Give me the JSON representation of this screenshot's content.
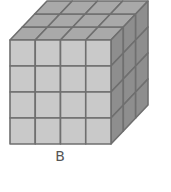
{
  "figure": {
    "label": "B",
    "front_grid": {
      "columns": 4,
      "rows": 4
    },
    "depth_layers": 3,
    "geometry": {
      "front": {
        "x0": 10,
        "y0": 40,
        "x1": 111,
        "y1": 144
      },
      "depth_offset": {
        "dx": 37,
        "dy": -39
      }
    },
    "colors": {
      "front": "#c9c9c9",
      "top": "#a9a9a9",
      "side": "#8e8e8e",
      "lines": "#6f6f6f",
      "label": "#555555"
    }
  }
}
